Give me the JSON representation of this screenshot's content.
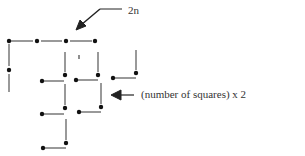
{
  "diagram": {
    "type": "matchstick-squares",
    "labels": {
      "top_annotation": "2n",
      "side_annotation": "(number of squares) x 2"
    },
    "colors": {
      "line": "#555555",
      "dot": "#111111",
      "text": "#333333",
      "background": "#ffffff"
    },
    "dots": [
      {
        "x": 9,
        "y": 41
      },
      {
        "x": 37,
        "y": 41
      },
      {
        "x": 66,
        "y": 41
      },
      {
        "x": 95,
        "y": 41
      },
      {
        "x": 9,
        "y": 70
      },
      {
        "x": 65,
        "y": 75
      },
      {
        "x": 98,
        "y": 75
      },
      {
        "x": 136,
        "y": 73
      },
      {
        "x": 42,
        "y": 81
      },
      {
        "x": 76,
        "y": 80
      },
      {
        "x": 113,
        "y": 78
      },
      {
        "x": 65,
        "y": 108
      },
      {
        "x": 101,
        "y": 107
      },
      {
        "x": 42,
        "y": 114
      },
      {
        "x": 79,
        "y": 112
      },
      {
        "x": 66,
        "y": 143
      },
      {
        "x": 43,
        "y": 148
      }
    ],
    "segments": [
      {
        "x1": 9,
        "y1": 41,
        "x2": 33,
        "y2": 41
      },
      {
        "x1": 41,
        "y1": 41,
        "x2": 62,
        "y2": 41
      },
      {
        "x1": 70,
        "y1": 41,
        "x2": 92,
        "y2": 41
      },
      {
        "x1": 9,
        "y1": 44,
        "x2": 9,
        "y2": 66
      },
      {
        "x1": 9,
        "y1": 74,
        "x2": 9,
        "y2": 92
      },
      {
        "x1": 65,
        "y1": 52,
        "x2": 65,
        "y2": 72
      },
      {
        "x1": 98,
        "y1": 52,
        "x2": 98,
        "y2": 72
      },
      {
        "x1": 136,
        "y1": 50,
        "x2": 136,
        "y2": 70
      },
      {
        "x1": 42,
        "y1": 81,
        "x2": 64,
        "y2": 81
      },
      {
        "x1": 76,
        "y1": 80,
        "x2": 98,
        "y2": 80
      },
      {
        "x1": 113,
        "y1": 78,
        "x2": 136,
        "y2": 78
      },
      {
        "x1": 65,
        "y1": 84,
        "x2": 65,
        "y2": 105
      },
      {
        "x1": 101,
        "y1": 83,
        "x2": 101,
        "y2": 104
      },
      {
        "x1": 42,
        "y1": 114,
        "x2": 64,
        "y2": 114
      },
      {
        "x1": 79,
        "y1": 112,
        "x2": 101,
        "y2": 112
      },
      {
        "x1": 66,
        "y1": 119,
        "x2": 66,
        "y2": 140
      },
      {
        "x1": 43,
        "y1": 148,
        "x2": 66,
        "y2": 148
      }
    ],
    "tick_mark": {
      "x": 79,
      "y1": 55,
      "y2": 59
    }
  }
}
